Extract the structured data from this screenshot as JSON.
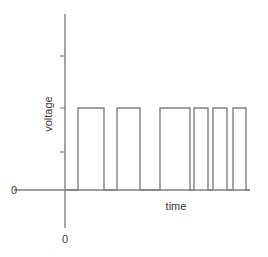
{
  "figure": {
    "name": "pwm-voltage-vs-time-waveform",
    "background_color": "#ffffff",
    "line_color": "#808080",
    "text_color": "#3a3a3a"
  },
  "labels": {
    "y_axis": "voltage",
    "x_axis": "time",
    "origin_left": "0",
    "origin_bottom": "0"
  },
  "chart_data": {
    "type": "line",
    "title": "",
    "xlabel": "time",
    "ylabel": "voltage",
    "grid": false,
    "legend": null,
    "xlim": [
      0,
      100
    ],
    "ylim": [
      0,
      1
    ],
    "axis_geometry": {
      "x_axis_start_px": 14,
      "x_axis_end_px": 250,
      "y_axis_top_px": 14,
      "y_axis_bottom_px": 228,
      "baseline_y_px": 190,
      "pulse_top_y_px": 108,
      "y_axis_x_px": 65,
      "y_ticks_px": [
        56,
        108,
        152
      ],
      "y_tick_side": "left"
    },
    "high_level": 1,
    "low_level": 0,
    "pulse_count": 6,
    "pulses": [
      {
        "index": 1,
        "start_px": 78,
        "end_px": 104
      },
      {
        "index": 2,
        "start_px": 117,
        "end_px": 140
      },
      {
        "index": 3,
        "start_px": 160,
        "end_px": 190
      },
      {
        "index": 4,
        "start_px": 194,
        "end_px": 208
      },
      {
        "index": 5,
        "start_px": 213,
        "end_px": 227
      },
      {
        "index": 6,
        "start_px": 233,
        "end_px": 246
      }
    ],
    "series": [
      {
        "name": "voltage",
        "x": [
          65,
          78,
          78,
          104,
          104,
          117,
          117,
          140,
          140,
          160,
          160,
          190,
          190,
          194,
          194,
          208,
          208,
          213,
          213,
          227,
          227,
          233,
          233,
          246,
          246,
          250
        ],
        "values": [
          0,
          0,
          1,
          1,
          0,
          0,
          1,
          1,
          0,
          0,
          1,
          1,
          0,
          0,
          1,
          1,
          0,
          0,
          1,
          1,
          0,
          0,
          1,
          1,
          0,
          0
        ]
      }
    ]
  }
}
